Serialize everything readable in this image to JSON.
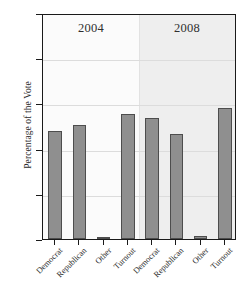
{
  "chart_data": {
    "type": "bar",
    "title": "",
    "xlabel": "",
    "ylabel": "Percentage of the Vote",
    "ylim": [
      0,
      100
    ],
    "yticks": [
      0,
      20,
      40,
      60,
      80,
      100
    ],
    "grid": true,
    "legend": "none",
    "panels": [
      {
        "label": "2004",
        "categories": [
          "Democrat",
          "Republican",
          "Other",
          "Turnout"
        ],
        "values": [
          48,
          50.5,
          1,
          55.5
        ]
      },
      {
        "label": "2008",
        "categories": [
          "Democrat",
          "Republican",
          "Other",
          "Turnout"
        ],
        "values": [
          53.5,
          46.5,
          1.5,
          58
        ]
      }
    ],
    "colors": {
      "bar_fill": "#8f8f8f",
      "bar_edge": "#4d4d4d",
      "panel_2004_bg": "#fbfbfb",
      "panel_2008_bg": "#eeeeee",
      "grid": "#dcdcdc",
      "axis": "#1a1a1a",
      "text": "#2b2b2b"
    }
  }
}
